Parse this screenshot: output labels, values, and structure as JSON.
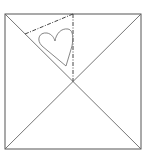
{
  "diagram": {
    "colors": {
      "background": "#ffffff",
      "outline": "#555555",
      "fold_lines": "#666666",
      "dash_lines": "#444444",
      "heart": "#777777"
    },
    "square": {
      "x": 5,
      "y": 14,
      "width": 136,
      "height": 135
    },
    "center": {
      "x": 73,
      "y": 81.5
    },
    "shapes": [
      "square-outline",
      "diagonal-lines",
      "dash-dot-fold-triangle",
      "heart-outline"
    ]
  }
}
